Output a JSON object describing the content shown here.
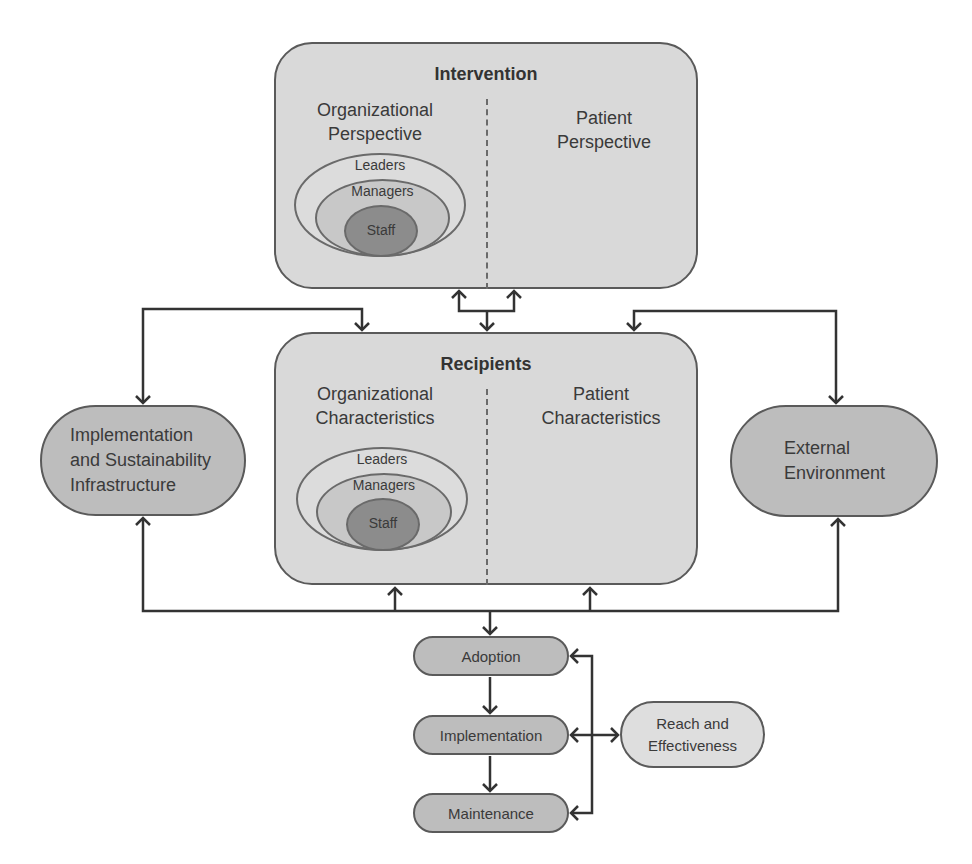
{
  "diagram": {
    "intervention": {
      "title": "Intervention",
      "left_label_line1": "Organizational",
      "left_label_line2": "Perspective",
      "right_label_line1": "Patient",
      "right_label_line2": "Perspective",
      "hierarchy": {
        "outer": "Leaders",
        "middle": "Managers",
        "inner": "Staff"
      }
    },
    "recipients": {
      "title": "Recipients",
      "left_label_line1": "Organizational",
      "left_label_line2": "Characteristics",
      "right_label_line1": "Patient",
      "right_label_line2": "Characteristics",
      "hierarchy": {
        "outer": "Leaders",
        "middle": "Managers",
        "inner": "Staff"
      }
    },
    "infrastructure": {
      "line1": "Implementation",
      "line2": "and Sustainability",
      "line3": "Infrastructure"
    },
    "external": {
      "line1": "External",
      "line2": "Environment"
    },
    "outcomes": {
      "adoption": "Adoption",
      "implementation": "Implementation",
      "maintenance": "Maintenance",
      "reach_line1": "Reach and",
      "reach_line2": "Effectiveness"
    },
    "colors": {
      "box_fill": "#d9d9d9",
      "pill_dark": "#bdbdbd",
      "pill_light": "#dedede",
      "staff_fill": "#8c8c8c",
      "managers_fill": "#c8c8c8",
      "leaders_fill": "#dcdcdc",
      "stroke": "#333333"
    }
  }
}
